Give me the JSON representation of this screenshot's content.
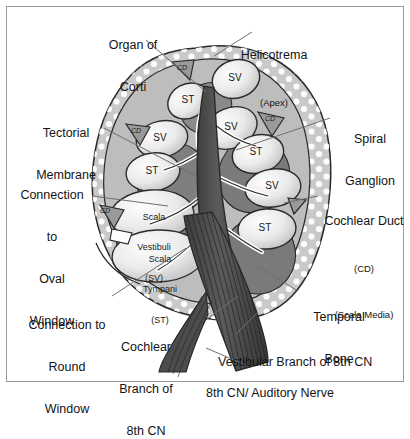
{
  "figure": {
    "kind": "anatomical-cross-section",
    "background_color": "#ffffff",
    "frame_color": "#9b9b9b",
    "bone_fill": "#c9c9c9",
    "bone_stipple": "#ffffff",
    "chamber_fill": "#efefef",
    "tissue_fill": "#8f8f8f",
    "tissue_dark": "#6e6e6e",
    "nerve_fill": "#4a4a4a",
    "outline_color": "#2a2a2a",
    "leader_color": "#6f6f6f"
  },
  "labels": {
    "organ_of_corti": {
      "line1": "Organ of",
      "line2": "Corti"
    },
    "helicotrema": {
      "line1": "Helicotrema",
      "sub": "(Apex)"
    },
    "tectorial_membrane": {
      "line1": "Tectorial",
      "line2": "Membrane"
    },
    "spiral_ganglion": {
      "line1": "Spiral",
      "line2": "Ganglion"
    },
    "oval_window": {
      "line1": "Connection",
      "line2": "to",
      "line3": "Oval",
      "line4": "Window"
    },
    "cochlear_duct": {
      "line1": "Cochlear Duct",
      "sub1": "(CD)",
      "sub2": "(Scala Media)"
    },
    "round_window": {
      "line1": "Connection to",
      "line2": "Round",
      "line3": "Window"
    },
    "temporal_bone": {
      "line1": "Temporal",
      "line2": "Bone"
    },
    "cochlear_branch": {
      "line1": "Cochlear",
      "line2": "Branch of",
      "line3": "8th CN"
    },
    "vestibular_branch": {
      "line1": "Vestibular Branch of 8th CN"
    },
    "auditory_nerve": {
      "line1": "8th CN/ Auditory Nerve"
    }
  },
  "inner_labels": {
    "scala_vestibuli": {
      "line1": "Scala",
      "line2": "Vestibuli",
      "line3": "(SV)"
    },
    "scala_tympani": {
      "line1": "Scala",
      "line2": "Tympani",
      "line3": "(ST)"
    },
    "sv_short": "SV",
    "st_short": "ST",
    "cd_short": "CD"
  },
  "chamber_markers": [
    {
      "id": "sv-apex",
      "text": "SV",
      "x": 235,
      "y": 78
    },
    {
      "id": "st-apex",
      "text": "ST",
      "x": 188,
      "y": 100
    },
    {
      "id": "cd-apex",
      "text": "CD",
      "x": 182,
      "y": 70
    },
    {
      "id": "sv-upper-right",
      "text": "SV",
      "x": 231,
      "y": 127
    },
    {
      "id": "cd-upper-right",
      "text": "CD",
      "x": 270,
      "y": 121
    },
    {
      "id": "st-upper-right",
      "text": "ST",
      "x": 256,
      "y": 152
    },
    {
      "id": "sv-left-mid",
      "text": "SV",
      "x": 160,
      "y": 138
    },
    {
      "id": "cd-left-mid",
      "text": "CD",
      "x": 136,
      "y": 133
    },
    {
      "id": "st-left-mid",
      "text": "ST",
      "x": 152,
      "y": 171
    },
    {
      "id": "sv-lower-right",
      "text": "SV",
      "x": 272,
      "y": 186
    },
    {
      "id": "st-lower-right",
      "text": "ST",
      "x": 265,
      "y": 228
    },
    {
      "id": "cd-left-low",
      "text": "CD",
      "x": 105,
      "y": 213
    }
  ]
}
